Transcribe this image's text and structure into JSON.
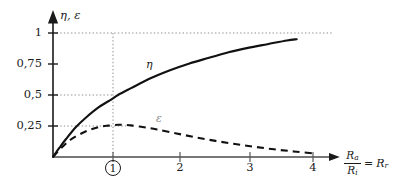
{
  "chart_data": {
    "type": "line",
    "title": "",
    "xlabel": "R_a/R_i = R_r",
    "ylabel": "eta, epsilon",
    "xlim": [
      0,
      4.45
    ],
    "ylim": [
      0,
      1.12
    ],
    "grid": "dotted-reference-lines",
    "legend_position": "inline-curve-labels",
    "x_ticks": [
      "1",
      "2",
      "3",
      "4"
    ],
    "x_tick_values": [
      1,
      2,
      3,
      4
    ],
    "x_tick_highlight": "1",
    "y_ticks": [
      "0,25",
      "0,5",
      "0,75",
      "1"
    ],
    "y_tick_values": [
      0.25,
      0.5,
      0.75,
      1
    ],
    "reference_lines": [
      {
        "axis": "y",
        "value": 1,
        "style": "dotted",
        "x_extent": [
          0,
          4.15
        ]
      },
      {
        "axis": "y",
        "value": 0.5,
        "style": "dotted",
        "x_extent": [
          0,
          1.0
        ]
      },
      {
        "axis": "y",
        "value": 0.25,
        "style": "dotted",
        "x_extent": [
          0,
          1.08
        ]
      },
      {
        "axis": "x",
        "value": 1,
        "style": "dotted",
        "y_extent": [
          0,
          1.0
        ]
      }
    ],
    "series": [
      {
        "name": "eta",
        "label": "η",
        "style": "solid",
        "color": "#111111",
        "x": [
          0,
          0.1,
          0.2,
          0.35,
          0.5,
          0.7,
          0.9,
          1.0,
          1.2,
          1.5,
          1.8,
          2.1,
          2.4,
          2.7,
          3.0,
          3.3,
          3.6,
          3.75
        ],
        "y": [
          0,
          0.075,
          0.145,
          0.24,
          0.315,
          0.4,
          0.465,
          0.5,
          0.555,
          0.635,
          0.7,
          0.755,
          0.8,
          0.845,
          0.88,
          0.91,
          0.94,
          0.95
        ]
      },
      {
        "name": "epsilon",
        "label": "ε",
        "style": "dashed",
        "color": "#111111",
        "x": [
          0,
          0.15,
          0.3,
          0.5,
          0.7,
          0.85,
          1.0,
          1.05,
          1.2,
          1.4,
          1.6,
          1.9,
          2.2,
          2.5,
          2.8,
          3.1,
          3.4,
          3.7,
          4.0
        ],
        "y": [
          0,
          0.085,
          0.15,
          0.205,
          0.24,
          0.253,
          0.26,
          0.26,
          0.255,
          0.24,
          0.222,
          0.19,
          0.158,
          0.13,
          0.105,
          0.082,
          0.062,
          0.045,
          0.03
        ]
      }
    ]
  },
  "axes": {
    "y_title": "η, ε",
    "x_title": {
      "numerator": "R",
      "numerator_sub": "a",
      "denominator": "R",
      "denominator_sub": "i",
      "equals": "=",
      "right": "R",
      "right_sub": "r"
    }
  },
  "labels": {
    "y_ticks": [
      "1",
      "0,75",
      "0,5",
      "0,25"
    ],
    "x_ticks": [
      "1",
      "2",
      "3",
      "4"
    ],
    "eta": "η",
    "epsilon": "ε"
  },
  "colors": {
    "background": "#ffffff",
    "axis": "#2a2a2a",
    "curve": "#111111",
    "grid": "#9a9a9a",
    "text": "#1a1a1a",
    "eps_label": "#8a8a8a"
  }
}
